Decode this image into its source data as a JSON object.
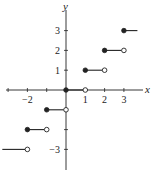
{
  "chart_data": {
    "type": "line",
    "title": "",
    "subtitle": "Greatest integer (floor) step function",
    "xlabel": "x",
    "ylabel": "y",
    "xlim": [
      -3.4,
      4.0
    ],
    "ylim": [
      -4.0,
      4.3
    ],
    "grid": false,
    "legend": "none",
    "xticks": [
      -3,
      -2,
      -1,
      1,
      2,
      3
    ],
    "xtick_labels": [
      {
        "value": -2,
        "label": "−2"
      },
      {
        "value": 1,
        "label": "1"
      },
      {
        "value": 2,
        "label": "2"
      },
      {
        "value": 3,
        "label": "3"
      }
    ],
    "yticks": [
      -3,
      -2,
      -1,
      1,
      2,
      3
    ],
    "ytick_labels": [
      {
        "value": 1,
        "label": "1"
      },
      {
        "value": 2,
        "label": "2"
      },
      {
        "value": 3,
        "label": "3"
      },
      {
        "value": -3,
        "label": "−3"
      }
    ],
    "segments": [
      {
        "x_start": -3.3,
        "x_end": -2,
        "y": -3,
        "start_closed": null,
        "end_closed": false
      },
      {
        "x_start": -2,
        "x_end": -1,
        "y": -2,
        "start_closed": true,
        "end_closed": false
      },
      {
        "x_start": -1,
        "x_end": 0,
        "y": -1,
        "start_closed": true,
        "end_closed": false
      },
      {
        "x_start": 0,
        "x_end": 1,
        "y": 0,
        "start_closed": true,
        "end_closed": false
      },
      {
        "x_start": 1,
        "x_end": 2,
        "y": 1,
        "start_closed": true,
        "end_closed": false
      },
      {
        "x_start": 2,
        "x_end": 3,
        "y": 2,
        "start_closed": true,
        "end_closed": false
      },
      {
        "x_start": 3,
        "x_end": 3.7,
        "y": 3,
        "start_closed": true,
        "end_closed": null
      }
    ]
  }
}
